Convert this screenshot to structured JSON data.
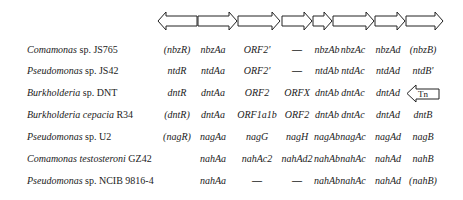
{
  "gene_arrows": [
    {
      "x1": 158,
      "x2": 197,
      "dir": "left"
    },
    {
      "x1": 198,
      "x2": 237,
      "dir": "right"
    },
    {
      "x1": 238,
      "x2": 280,
      "dir": "right"
    },
    {
      "x1": 282,
      "x2": 312,
      "dir": "right"
    },
    {
      "x1": 313,
      "x2": 332,
      "dir": "right"
    },
    {
      "x1": 333,
      "x2": 374,
      "dir": "right"
    },
    {
      "x1": 375,
      "x2": 405,
      "dir": "right"
    },
    {
      "x1": 406,
      "x2": 443,
      "dir": "right"
    }
  ],
  "columns_x": [
    177,
    213,
    257,
    297,
    327,
    353,
    388,
    423
  ],
  "rows": [
    {
      "genus": "Comamonas",
      "species": "sp. JS765",
      "genes": [
        "(nbzR)",
        "nbzAa",
        "ORF2'",
        "—",
        "nbzAb",
        "nbzAc",
        "nbzAd",
        "(nbzB)"
      ]
    },
    {
      "genus": "Pseudomonas",
      "species": "sp. JS42",
      "genes": [
        "ntdR",
        "ntdAa",
        "ORF2'",
        "—",
        "ntdAb",
        "ntdAc",
        "ntdAd",
        "ntdB'"
      ]
    },
    {
      "genus": "Burkholderia",
      "species": "sp. DNT",
      "genes": [
        "dntR",
        "dntAa",
        "ORF2",
        "ORFX",
        "dntAb",
        "dntAc",
        "dntAd",
        ""
      ]
    },
    {
      "genus": "Burkholderia cepacia",
      "species": "R34",
      "genes": [
        "(dntR)",
        "dntAa",
        "ORF1a1b",
        "ORF2",
        "dntAb",
        "dntAc",
        "dntAd",
        "dntB"
      ]
    },
    {
      "genus": "Pseudomonas",
      "species": "sp. U2",
      "genes": [
        "(nagR)",
        "nagAa",
        "nagG",
        "nagH",
        "nagAb",
        "nagAc",
        "nagAd",
        "nagB"
      ]
    },
    {
      "genus": "Comamonas testosteroni",
      "species": "GZ42",
      "genes": [
        "",
        "nahAa",
        "nahAc2",
        "nahAd2",
        "nahAb",
        "nahAc",
        "nahAd",
        "nahB"
      ]
    },
    {
      "genus": "Pseudomonas",
      "species": "sp. NCIB 9816-4",
      "genes": [
        "",
        "nahAa",
        "—",
        "—",
        "nahAb",
        "nahAc",
        "nahAd",
        "(nahB)"
      ]
    }
  ],
  "transposon": {
    "label": "Tn"
  }
}
